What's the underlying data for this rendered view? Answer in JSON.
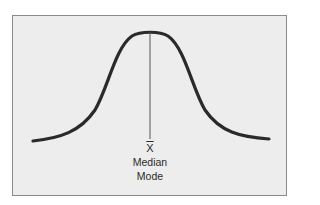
{
  "diagram": {
    "type": "normal-distribution-curve",
    "curve_color": "#2a2a2a",
    "center_line_color": "#555555",
    "background_color": "#ededed",
    "border_color": "#8a8a8a",
    "labels": {
      "mean_symbol": "X",
      "median": "Median",
      "mode": "Mode"
    }
  }
}
